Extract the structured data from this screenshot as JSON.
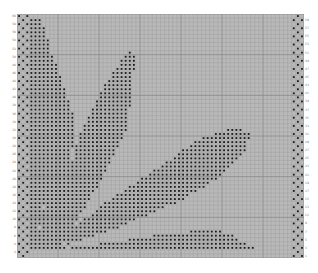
{
  "chart": {
    "title": "",
    "type": "knitting-chart",
    "columns": 70,
    "rows": 60,
    "cell_px": 4.1,
    "colors": {
      "background": "#ffffff",
      "cell": "#b9b9b9",
      "grid_line": "#999999",
      "grid_line_major": "#888888",
      "stitch_dot": "#1a1a1a",
      "cell_light": "#c6c6c6"
    },
    "row_labels_right": [
      "1",
      "3",
      "5",
      "7",
      "9",
      "11",
      "13",
      "15",
      "17",
      "19",
      "21",
      "23",
      "25",
      "27",
      "29",
      "31",
      "33",
      "35",
      "37",
      "39",
      "41",
      "43",
      "45",
      "47",
      "49",
      "51",
      "53",
      "55",
      "57",
      "59"
    ],
    "row_labels_left": [
      "2",
      "4",
      "6",
      "8",
      "10",
      "12",
      "14",
      "16",
      "18",
      "20",
      "22",
      "24",
      "26",
      "28",
      "30",
      "32",
      "34",
      "36",
      "38",
      "40",
      "42",
      "44",
      "46",
      "48",
      "50",
      "52",
      "54",
      "56",
      "58",
      "60"
    ],
    "border_columns_left": 3,
    "border_columns_right": 3,
    "shapes": [
      {
        "name": "left-stem-leaf",
        "polygon": [
          [
            3,
            1
          ],
          [
            6,
            1
          ],
          [
            8,
            8
          ],
          [
            9,
            20
          ],
          [
            8,
            40
          ],
          [
            6,
            50
          ],
          [
            4,
            57
          ],
          [
            3,
            57
          ]
        ]
      },
      {
        "name": "left-tall-leaf",
        "polygon": [
          [
            6,
            8
          ],
          [
            9,
            10
          ],
          [
            14,
            26
          ],
          [
            13,
            40
          ],
          [
            10,
            52
          ],
          [
            8,
            57
          ],
          [
            6,
            57
          ],
          [
            7,
            40
          ],
          [
            8,
            20
          ]
        ]
      },
      {
        "name": "center-upper-leaf",
        "polygon": [
          [
            27,
            9
          ],
          [
            29,
            10
          ],
          [
            27,
            28
          ],
          [
            20,
            42
          ],
          [
            14,
            52
          ],
          [
            10,
            57
          ],
          [
            9,
            55
          ],
          [
            12,
            42
          ],
          [
            15,
            30
          ],
          [
            21,
            18
          ]
        ]
      },
      {
        "name": "right-large-leaf",
        "polygon": [
          [
            53,
            28
          ],
          [
            57,
            29
          ],
          [
            56,
            33
          ],
          [
            50,
            40
          ],
          [
            40,
            46
          ],
          [
            26,
            52
          ],
          [
            12,
            57
          ],
          [
            11,
            55
          ],
          [
            22,
            46
          ],
          [
            34,
            38
          ],
          [
            44,
            31
          ]
        ]
      },
      {
        "name": "bottom-leaf",
        "polygon": [
          [
            48,
            53
          ],
          [
            52,
            54
          ],
          [
            57,
            57
          ],
          [
            60,
            58
          ],
          [
            10,
            58
          ],
          [
            24,
            56
          ],
          [
            36,
            54
          ]
        ]
      },
      {
        "name": "corner-cluster",
        "polygon": [
          [
            3,
            53
          ],
          [
            10,
            53
          ],
          [
            12,
            58
          ],
          [
            3,
            58
          ]
        ]
      }
    ]
  }
}
